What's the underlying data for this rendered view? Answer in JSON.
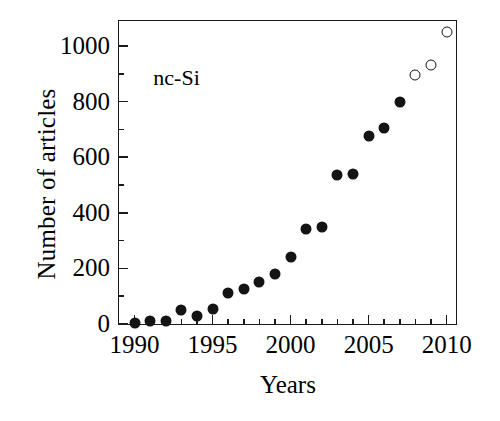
{
  "chart_data": {
    "type": "scatter",
    "title": "",
    "annotation": "nc-Si",
    "xlabel": "Years",
    "ylabel": "Number of articles",
    "xlim": [
      1989,
      2010.6
    ],
    "ylim": [
      0,
      1090
    ],
    "grid": false,
    "legend": "none",
    "xticks": [
      1990,
      1995,
      2000,
      2005,
      2010
    ],
    "xtick_labels": [
      "1990",
      "1995",
      "2000",
      "2005",
      "2010"
    ],
    "xminor_step": 1,
    "yticks": [
      0,
      200,
      400,
      600,
      800,
      1000
    ],
    "ytick_labels": [
      "0",
      "200",
      "400",
      "600",
      "800",
      "1000"
    ],
    "yminor_step": 100,
    "series": [
      {
        "name": "reported",
        "marker": "filled-circle",
        "color": "#141414",
        "x": [
          1990,
          1991,
          1992,
          1993,
          1994,
          1995,
          1996,
          1997,
          1998,
          1999,
          2000,
          2001,
          2002,
          2003,
          2004,
          2005,
          2006,
          2007
        ],
        "values": [
          5,
          12,
          10,
          50,
          28,
          55,
          110,
          125,
          152,
          180,
          240,
          340,
          350,
          535,
          540,
          675,
          705,
          800
        ]
      },
      {
        "name": "projected",
        "marker": "open-circle",
        "color": "#141414",
        "x": [
          2008,
          2009,
          2010
        ],
        "values": [
          895,
          930,
          1050
        ]
      }
    ]
  }
}
